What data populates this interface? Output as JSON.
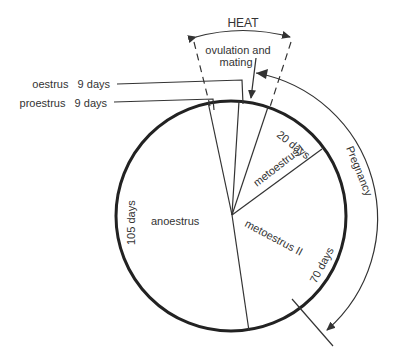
{
  "diagram": {
    "title": "HEAT",
    "ovulation_label_line1": "ovulation and",
    "ovulation_label_line2": "mating",
    "phases": [
      {
        "name": "oestrus",
        "duration": "9 days",
        "label": "oestrus   9 days"
      },
      {
        "name": "proestrus",
        "duration": "9 days",
        "label": "proestrus   9 days"
      },
      {
        "name": "metoestrus I",
        "duration": "20 days",
        "label": "metoestrus I"
      },
      {
        "name": "metoestrus II",
        "duration": "70 days",
        "label": "metoestrus II"
      },
      {
        "name": "anoestrus",
        "duration": "105 days",
        "label": "anoestrus"
      }
    ],
    "duration_labels": {
      "metI": "20 days",
      "metII": "70 days",
      "anoestrus": "105 days"
    },
    "pregnancy_label": "Pregnancy",
    "colors": {
      "line": "#333333",
      "circle": "#222222",
      "background": "#ffffff"
    }
  }
}
